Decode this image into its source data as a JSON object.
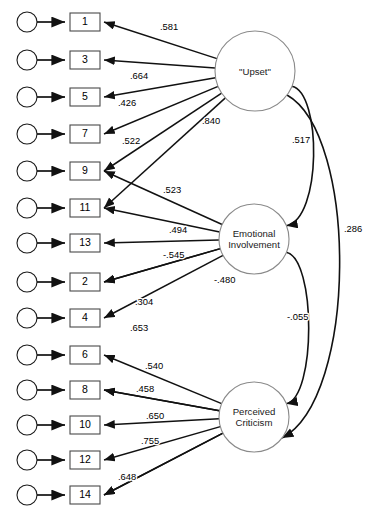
{
  "diagram": {
    "type": "sem-path-diagram",
    "title": "",
    "width": 373,
    "height": 527,
    "colors": {
      "background": "#ffffff",
      "line": "#111111",
      "box_stroke": "#4a4a4a",
      "circle_stroke": "#8a8a8a",
      "text": "#000000"
    },
    "latent_variables": [
      {
        "id": "upset",
        "label_lines": [
          "\"Upset\""
        ],
        "cx": 255,
        "cy": 71,
        "r": 40
      },
      {
        "id": "emotional_involvement",
        "label_lines": [
          "Emotional",
          "Involvement"
        ],
        "cx": 254,
        "cy": 239,
        "r": 35
      },
      {
        "id": "perceived_criticism",
        "label_lines": [
          "Perceived",
          "Criticism"
        ],
        "cx": 254,
        "cy": 417,
        "r": 35
      }
    ],
    "indicators": [
      {
        "id": "i1",
        "label": "1",
        "y": 22,
        "latent": "upset",
        "coef": ".581",
        "coef_x": 160,
        "coef_y": 30
      },
      {
        "id": "i3",
        "label": "3",
        "y": 60,
        "latent": "upset",
        "coef": ".664",
        "coef_x": 130,
        "coef_y": 79
      },
      {
        "id": "i5",
        "label": "5",
        "y": 97,
        "latent": "upset",
        "coef": ".426",
        "coef_x": 118,
        "coef_y": 106
      },
      {
        "id": "i7",
        "label": "7",
        "y": 134,
        "latent": "upset",
        "coef": ".522",
        "coef_x": 122,
        "coef_y": 144
      },
      {
        "id": "i9",
        "label": "9",
        "y": 171,
        "latent": "upset",
        "coef": "",
        "coef_x": 0,
        "coef_y": 0
      },
      {
        "id": "i11",
        "label": "11",
        "y": 208,
        "latent": "upset",
        "coef": ".523",
        "coef_x": 163,
        "coef_y": 193
      },
      {
        "id": "i13",
        "label": "13",
        "y": 243,
        "latent": "emotional_involvement",
        "coef": ".494",
        "coef_x": 169,
        "coef_y": 233
      },
      {
        "id": "i2",
        "label": "2",
        "y": 282,
        "latent": "emotional_involvement",
        "coef": "-.545",
        "coef_x": 163,
        "coef_y": 258
      },
      {
        "id": "i4",
        "label": "4",
        "y": 318,
        "latent": "emotional_involvement",
        "coef": ".304",
        "coef_x": 135,
        "coef_y": 305
      },
      {
        "id": "i6",
        "label": "6",
        "y": 355,
        "latent": "perceived_criticism",
        "coef": ".653",
        "coef_x": 130,
        "coef_y": 331
      },
      {
        "id": "i8",
        "label": "8",
        "y": 390,
        "latent": "perceived_criticism",
        "coef": ".540",
        "coef_x": 145,
        "coef_y": 369
      },
      {
        "id": "i10",
        "label": "10",
        "y": 425,
        "latent": "perceived_criticism",
        "coef": ".458",
        "coef_x": 136,
        "coef_y": 392
      },
      {
        "id": "i12",
        "label": "12",
        "y": 460,
        "latent": "perceived_criticism",
        "coef": ".650",
        "coef_x": 146,
        "coef_y": 419
      },
      {
        "id": "i14",
        "label": "14",
        "y": 495,
        "latent": "perceived_criticism",
        "coef": ".755",
        "coef_x": 141,
        "coef_y": 444
      }
    ],
    "extra_loadings": [
      {
        "id": "ei_9",
        "latent": "emotional_involvement",
        "target_y": 171,
        "coef": "",
        "coef_x": 0,
        "coef_y": 0
      },
      {
        "id": "ei_11",
        "latent": "emotional_involvement",
        "target_y": 208,
        "coef": "",
        "coef_x": 0,
        "coef_y": 0
      },
      {
        "id": "ei_2b",
        "latent": "emotional_involvement",
        "target_y": 282,
        "coef": "-.480",
        "coef_x": 214,
        "coef_y": 283
      },
      {
        "id": "pc_8",
        "latent": "perceived_criticism",
        "target_y": 390,
        "coef": "",
        "coef_x": 0,
        "coef_y": 0
      },
      {
        "id": "pc_14",
        "latent": "perceived_criticism",
        "target_y": 495,
        "coef": ".648",
        "coef_x": 118,
        "coef_y": 480
      }
    ],
    "covariances": [
      {
        "id": "cov_upset_ei",
        "from": "upset",
        "to": "emotional_involvement",
        "coef": ".517",
        "coef_x": 292,
        "coef_y": 143
      },
      {
        "id": "cov_ei_pc",
        "from": "emotional_involvement",
        "to": "perceived_criticism",
        "coef": "-.055",
        "coef_x": 287,
        "coef_y": 320
      },
      {
        "id": "cov_upset_pc",
        "from": "upset",
        "to": "perceived_criticism",
        "coef": ".286",
        "coef_x": 344,
        "coef_y": 232
      }
    ]
  }
}
